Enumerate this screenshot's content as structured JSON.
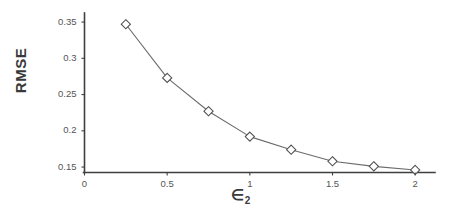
{
  "chart_data": {
    "type": "line",
    "title": "",
    "subtitle": "",
    "xlabel": "∈₂",
    "xlabel_base": "∈",
    "xlabel_sub": "2",
    "ylabel": "RMSE",
    "x": [
      0.25,
      0.5,
      0.75,
      1.0,
      1.25,
      1.5,
      1.75,
      2.0
    ],
    "values": [
      0.347,
      0.273,
      0.227,
      0.192,
      0.174,
      0.158,
      0.151,
      0.146
    ],
    "series": [
      {
        "name": "RMSE",
        "values": [
          0.347,
          0.273,
          0.227,
          0.192,
          0.174,
          0.158,
          0.151,
          0.146
        ]
      }
    ],
    "xlim": [
      0,
      2.12
    ],
    "ylim": [
      0.1425,
      0.3625
    ],
    "xticks": [
      0,
      0.5,
      1,
      1.5,
      2
    ],
    "xtick_labels": [
      "0",
      "0.5",
      "1",
      "1.5",
      "2"
    ],
    "yticks": [
      0.15,
      0.2,
      0.25,
      0.3,
      0.35
    ],
    "ytick_labels": [
      "0.15",
      "0.2",
      "0.25",
      "0.3",
      "0.35"
    ],
    "grid": false,
    "legend": false,
    "legend_position": "none",
    "marker": "open-diamond",
    "line_style": "solid-thin",
    "line_color": "#6b6b6b",
    "marker_edge_color": "#4f4f4f",
    "marker_face_color": "#ffffff",
    "axis_color": "#3f3f3f",
    "background_color": "#ffffff",
    "annotations": []
  }
}
